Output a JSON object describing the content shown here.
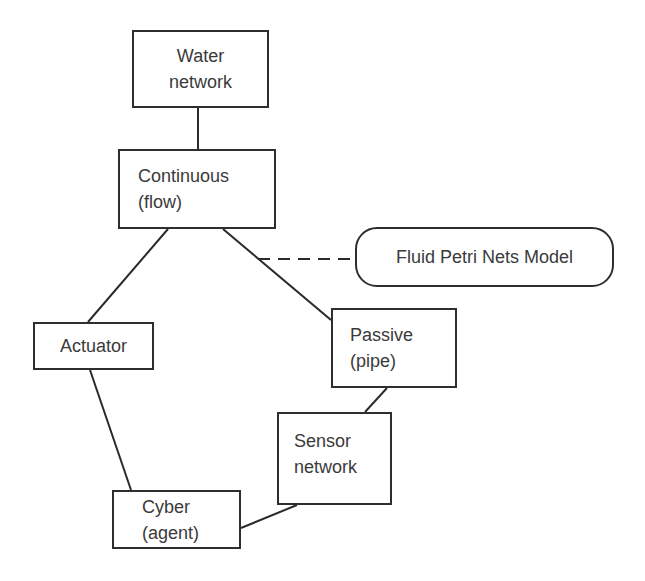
{
  "diagram": {
    "nodes": {
      "water_network": {
        "line1": "Water",
        "line2": "network",
        "shape": "rectangle",
        "box": [
          132,
          30,
          137,
          78
        ]
      },
      "continuous": {
        "line1": "Continuous",
        "line2": "(flow)",
        "shape": "rectangle",
        "box": [
          118,
          149,
          158,
          80
        ]
      },
      "fluid_petri_nets": {
        "line1": "Fluid Petri Nets Model",
        "shape": "rounded-rectangle",
        "box": [
          355,
          227,
          259,
          60
        ]
      },
      "actuator": {
        "line1": "Actuator",
        "shape": "rectangle",
        "box": [
          33,
          322,
          121,
          48
        ]
      },
      "passive": {
        "line1": "Passive",
        "line2": "(pipe)",
        "shape": "rectangle",
        "box": [
          331,
          308,
          126,
          80
        ]
      },
      "sensor_network": {
        "line1": "Sensor",
        "line2": "network",
        "shape": "rectangle",
        "box": [
          277,
          412,
          115,
          93
        ]
      },
      "cyber": {
        "line1": "Cyber",
        "line2": "(agent)",
        "shape": "rectangle",
        "box": [
          112,
          490,
          129,
          59
        ]
      }
    },
    "edges": [
      {
        "from": "water_network",
        "to": "continuous",
        "style": "solid"
      },
      {
        "from": "continuous",
        "to": "actuator",
        "style": "solid"
      },
      {
        "from": "continuous",
        "to": "passive",
        "style": "solid"
      },
      {
        "from": "continuous-passive-edge",
        "to": "fluid_petri_nets",
        "style": "dashed"
      },
      {
        "from": "actuator",
        "to": "cyber",
        "style": "solid"
      },
      {
        "from": "passive",
        "to": "sensor_network",
        "style": "solid"
      },
      {
        "from": "sensor_network",
        "to": "cyber",
        "style": "solid"
      }
    ],
    "colors": {
      "stroke": "#2e2e2e",
      "text": "#3a3a3a",
      "background": "#ffffff"
    }
  }
}
